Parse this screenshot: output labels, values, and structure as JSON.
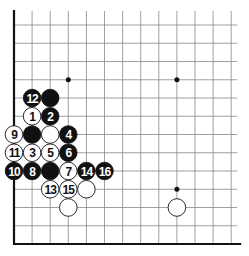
{
  "board": {
    "origin_x": 14,
    "origin_y": 25,
    "spacing_x": 18.1,
    "spacing_y": 18.25,
    "cols": 13,
    "rows": 13,
    "line_color": "#888888",
    "edge_color": "#111111",
    "black_color": "#111111",
    "white_color": "#ffffff"
  },
  "star_points": [
    {
      "col": 3,
      "row": 3
    },
    {
      "col": 9,
      "row": 3
    },
    {
      "col": 9,
      "row": 9
    }
  ],
  "stones": [
    {
      "color": "black",
      "col": 1,
      "row": 4,
      "label": "12"
    },
    {
      "color": "black",
      "col": 2,
      "row": 4,
      "label": ""
    },
    {
      "color": "white",
      "col": 1,
      "row": 5,
      "label": "1"
    },
    {
      "color": "black",
      "col": 2,
      "row": 5,
      "label": "2"
    },
    {
      "color": "white",
      "col": 0,
      "row": 6,
      "label": "9"
    },
    {
      "color": "black",
      "col": 1,
      "row": 6,
      "label": ""
    },
    {
      "color": "white",
      "col": 2,
      "row": 6,
      "label": ""
    },
    {
      "color": "black",
      "col": 3,
      "row": 6,
      "label": "4"
    },
    {
      "color": "white",
      "col": 0,
      "row": 7,
      "label": "11"
    },
    {
      "color": "white",
      "col": 1,
      "row": 7,
      "label": "3"
    },
    {
      "color": "white",
      "col": 2,
      "row": 7,
      "label": "5"
    },
    {
      "color": "black",
      "col": 3,
      "row": 7,
      "label": "6"
    },
    {
      "color": "black",
      "col": 0,
      "row": 8,
      "label": "10"
    },
    {
      "color": "black",
      "col": 1,
      "row": 8,
      "label": "8"
    },
    {
      "color": "black",
      "col": 2,
      "row": 8,
      "label": ""
    },
    {
      "color": "white",
      "col": 3,
      "row": 8,
      "label": "7"
    },
    {
      "color": "black",
      "col": 4,
      "row": 8,
      "label": "14"
    },
    {
      "color": "black",
      "col": 5,
      "row": 8,
      "label": "16"
    },
    {
      "color": "white",
      "col": 2,
      "row": 9,
      "label": "13"
    },
    {
      "color": "white",
      "col": 3,
      "row": 9,
      "label": "15"
    },
    {
      "color": "white",
      "col": 4,
      "row": 9,
      "label": ""
    },
    {
      "color": "white",
      "col": 3,
      "row": 10,
      "label": ""
    },
    {
      "color": "white",
      "col": 9,
      "row": 10,
      "label": ""
    }
  ]
}
